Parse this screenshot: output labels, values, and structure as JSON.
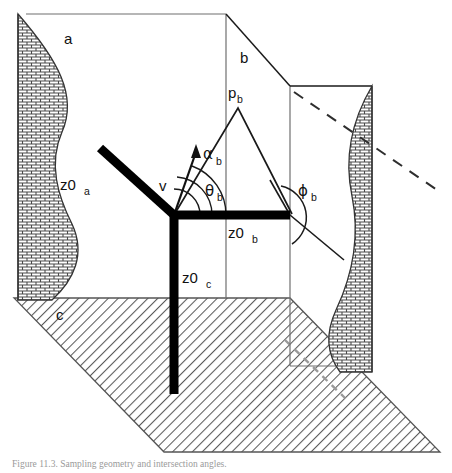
{
  "figure": {
    "domain": "diagram",
    "type": "3d-geometry-schematic",
    "title_caption": "Figure 11.3.  Sampling geometry and intersection angles.",
    "background_color": "#ffffff",
    "line_color": "#111111",
    "thick_axis_color": "#000000",
    "hatch_color": "#555555",
    "dashed_color": "#333333"
  },
  "labels": {
    "plane_a": {
      "text": "a",
      "sub": ""
    },
    "plane_b": {
      "text": "b",
      "sub": ""
    },
    "plane_c": {
      "text": "c",
      "sub": ""
    },
    "point_pb": {
      "text": "p",
      "sub": "b"
    },
    "axis_z0a": {
      "text": "z0",
      "sub": "a"
    },
    "axis_z0b": {
      "text": "z0",
      "sub": "b"
    },
    "axis_z0c": {
      "text": "z0",
      "sub": "c"
    },
    "vector_v": {
      "text": "v",
      "sub": ""
    },
    "angle_alpha_b": {
      "text": "α",
      "sub": "b"
    },
    "angle_theta_b": {
      "text": "θ",
      "sub": "b"
    },
    "angle_phi_b": {
      "text": "ϕ",
      "sub": "b"
    }
  },
  "geometry": {
    "origin": {
      "x": 174,
      "y": 215
    },
    "point_pb": {
      "x": 238,
      "y": 108
    },
    "axis_z0a_end": {
      "x": 98,
      "y": 147
    },
    "axis_z0b_end": {
      "x": 290,
      "y": 215
    },
    "axis_z0c_end": {
      "x": 174,
      "y": 394
    },
    "vector_v_tip": {
      "x": 196,
      "y": 148
    },
    "angle_arc_radii": [
      26,
      38,
      52
    ],
    "phi_arc_radius": 30
  },
  "elements": {
    "left_wall": "brick-hatched vertical wall with wavy inner edge",
    "right_wall": "brick-hatched vertical wall with wavy edge",
    "ground_plane": "diagonal line-hatched parallelogram",
    "dashed_ray": "dashed sight line from upper-left to lower-right",
    "dashed_ground_line": "faint dashed line across ground plane"
  }
}
